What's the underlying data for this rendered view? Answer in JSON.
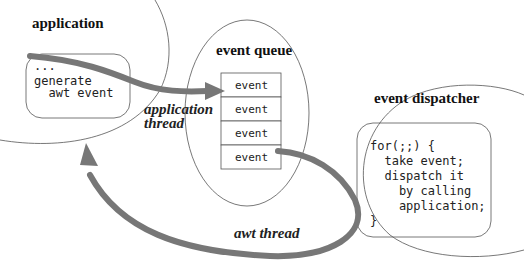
{
  "diagram": {
    "application": {
      "title": "application",
      "code": [
        "...",
        "generate",
        "  awt event"
      ]
    },
    "event_queue": {
      "title": "event queue",
      "items": [
        "event",
        "event",
        "event",
        "event"
      ]
    },
    "event_dispatcher": {
      "title": "event dispatcher",
      "code": [
        "for(;;) {",
        "  take event;",
        "  dispatch it",
        "    by calling",
        "    application;",
        "}"
      ]
    },
    "arrows": {
      "application_thread": {
        "label_line1": "application",
        "label_line2": "thread"
      },
      "awt_thread": {
        "label": "awt thread"
      }
    },
    "colors": {
      "arrow": "#777777",
      "outline": "#555555"
    }
  }
}
